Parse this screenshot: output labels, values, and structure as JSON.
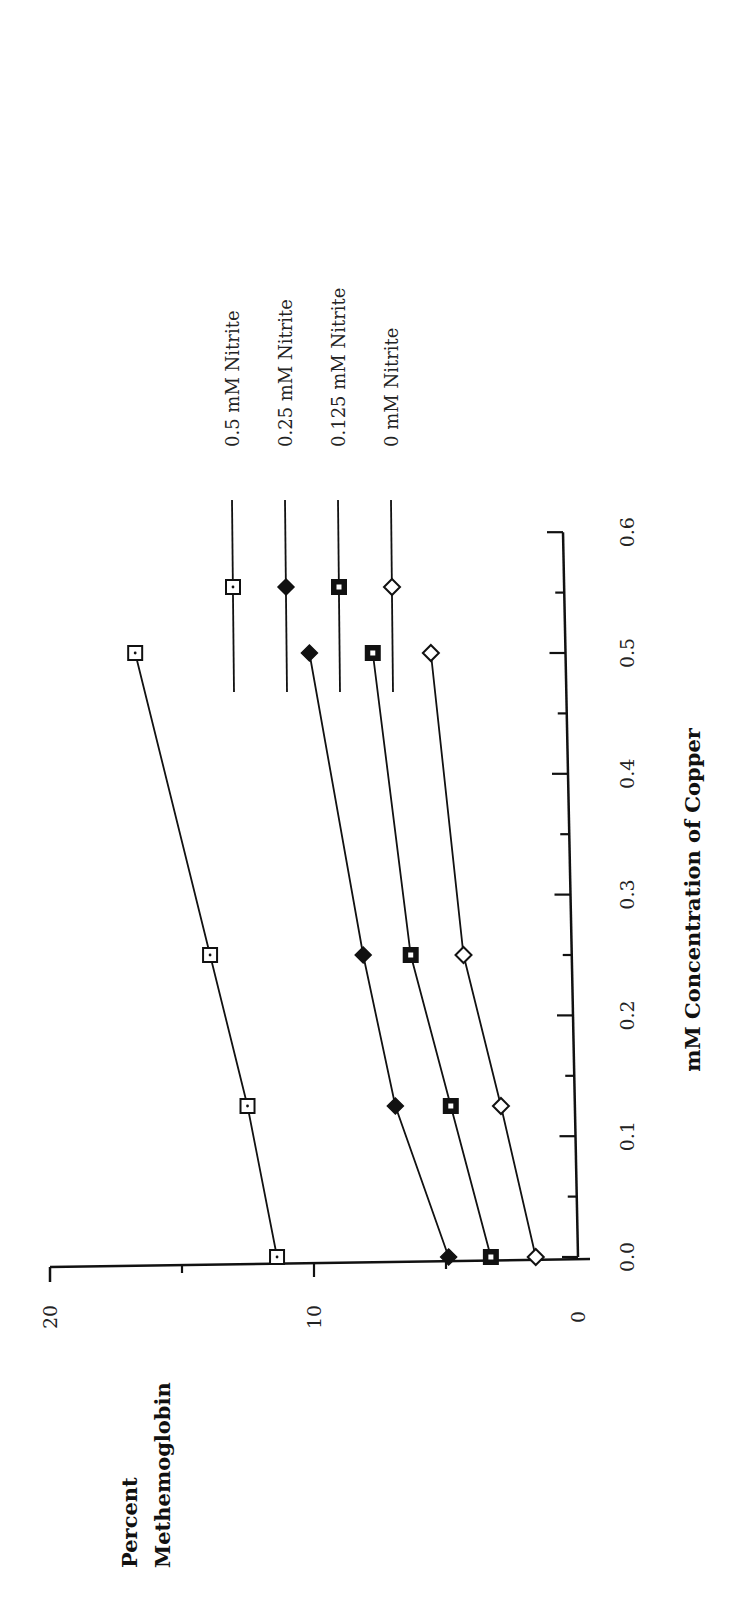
{
  "chart_data": {
    "type": "line",
    "orientation": "rotated 90 degrees counter-clockwise (page displayed in portrait)",
    "title": "",
    "xlabel": "mM Concentration of Copper",
    "ylabel": "Percent Methemoglobin",
    "ylabel_lines": [
      "Percent",
      "Methemoglobin"
    ],
    "x_ticks": [
      "0.0",
      "0.1",
      "0.2",
      "0.3",
      "0.4",
      "0.5",
      "0.6"
    ],
    "x_tick_values": [
      0.0,
      0.1,
      0.2,
      0.3,
      0.4,
      0.5,
      0.6
    ],
    "y_ticks": [
      "0",
      "10",
      "20"
    ],
    "y_tick_values": [
      0,
      10,
      20
    ],
    "xlim": [
      0,
      0.6
    ],
    "ylim": [
      0,
      20
    ],
    "grid": false,
    "legend_position": "right (top of rotated page)",
    "x": [
      0.0,
      0.125,
      0.25,
      0.5
    ],
    "series": [
      {
        "name": "0.5 mM Nitrite",
        "marker": "open-square-dot",
        "values": [
          11.4,
          12.4,
          13.7,
          16.3
        ]
      },
      {
        "name": "0.25 mM Nitrite",
        "marker": "filled-diamond",
        "values": [
          4.9,
          6.8,
          7.9,
          9.7
        ]
      },
      {
        "name": "0.125 mM Nitrite",
        "marker": "filled-square-dot",
        "values": [
          3.3,
          4.7,
          6.1,
          7.3
        ]
      },
      {
        "name": "0 mM Nitrite",
        "marker": "open-diamond",
        "values": [
          1.6,
          2.8,
          4.1,
          5.1
        ]
      }
    ]
  },
  "legend": {
    "items": [
      {
        "label": "0.5 mM Nitrite"
      },
      {
        "label": "0.25 mM Nitrite"
      },
      {
        "label": "0.125 mM Nitrite"
      },
      {
        "label": "0 mM Nitrite"
      }
    ]
  },
  "colors": {
    "ink": "#111111",
    "background": "#ffffff"
  }
}
